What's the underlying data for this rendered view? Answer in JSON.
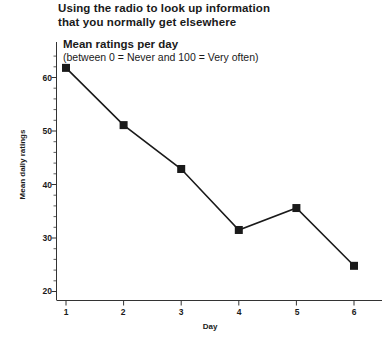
{
  "title": {
    "line1": "Using the radio to look up information",
    "line2": "that you normally get elsewhere"
  },
  "subtitle": {
    "main": "Mean ratings per day",
    "scale_note": "(between 0 = Never and 100 = Very often)"
  },
  "chart_data": {
    "type": "line",
    "title": "Using the radio to look up information that you normally get elsewhere",
    "subtitle": "Mean ratings per day (between 0 = Never and 100 = Very often)",
    "xlabel": "Day",
    "ylabel": "Mean daily ratings",
    "categories": [
      "1",
      "2",
      "3",
      "4",
      "5",
      "6"
    ],
    "x": [
      1,
      2,
      3,
      4,
      5,
      6
    ],
    "values": [
      61.8,
      51.1,
      42.9,
      31.5,
      35.6,
      24.8
    ],
    "series": [
      {
        "name": "Mean daily ratings",
        "values": [
          61.8,
          51.1,
          42.9,
          31.5,
          35.6,
          24.8
        ]
      }
    ],
    "xlim": [
      0.6,
      6.6
    ],
    "ylim": [
      18,
      64
    ],
    "y_ticks": [
      20,
      30,
      40,
      50,
      60
    ],
    "y_tick_labels": [
      "20",
      "30",
      "40",
      "50",
      "60"
    ],
    "y_minor_tick_step": 2,
    "x_ticks": [
      1,
      2,
      3,
      4,
      5,
      6
    ],
    "x_tick_labels": [
      "1",
      "2",
      "3",
      "4",
      "5",
      "6"
    ],
    "grid": false,
    "legend": null,
    "marker": "square",
    "marker_color": "#1a1a1a",
    "line_color": "#1a1a1a"
  },
  "colors": {
    "line": "#1a1a1a",
    "marker": "#1a1a1a",
    "axis": "#333333",
    "text": "#1a1a1a",
    "background": "#ffffff"
  }
}
